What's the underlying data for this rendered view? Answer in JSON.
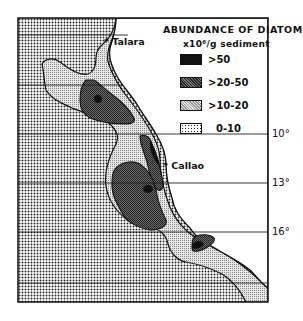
{
  "map": {
    "title": "ABUNDANCE OF DIATOMS",
    "unit": "x10⁶/g sediment",
    "legend": [
      {
        "label": ">50",
        "pattern": "solid-black",
        "color": "#111111"
      },
      {
        "label": ">20-50",
        "pattern": "dense-dark-stipple",
        "color": "#4a4a4a"
      },
      {
        "label": ">10-20",
        "pattern": "light-stipple",
        "color": "#c8c8c8"
      },
      {
        "label": "0-10",
        "pattern": "coarse-dot-stipple",
        "color": "#9a9a9a"
      }
    ],
    "places": [
      {
        "name": "Talara",
        "marker": "*"
      },
      {
        "name": "Callao",
        "marker": "*"
      }
    ],
    "latitudes": [
      {
        "label": "10°"
      },
      {
        "label": "13°"
      },
      {
        "label": "16°"
      }
    ]
  }
}
